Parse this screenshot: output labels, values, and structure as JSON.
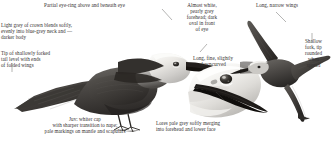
{
  "plate": {
    "subject": "noddy-tern-field-guide-plate",
    "background": "#ffffff",
    "text_color": "#333030"
  },
  "illustrations": [
    {
      "name": "perched-bird",
      "description": "Perched noddy in profile facing right, pale grey crown blending into blue-grey neck and dark brown-grey body, long dark bill, short dark legs with webbed feet",
      "position": "upper-left-to-center"
    },
    {
      "name": "head-study",
      "description": "Large close-up head study facing left, whitish pearly forehead and cap, dark oval before eye, long fine slightly downcurved black bill",
      "position": "lower-center"
    },
    {
      "name": "flying-bird",
      "description": "Bird in flight from above, long narrow pointed wings, shallow forked tail",
      "position": "right"
    }
  ],
  "labels": {
    "eyering": "Partial eye-ring above and beneath eye",
    "crown": "Light grey of crown blends softly,\nevenly into blue-grey neck and  —\ndarker body",
    "tail": "Tip of shallowly forked\ntail level with ends\nof folded wings",
    "juvenile": "Juv: whiter cap\nwith sharper transition to nape;\npale markings on mantle and scapulars",
    "forehead": "Almost white,\npearly grey\nforehead; dark\noval in front\nof eye",
    "bill": "Long, fine, slightly\ndowncurved",
    "lores": "Lores pale grey softly merging\ninto forehead and lower face",
    "wings": "Long, narrow wings",
    "fork": "Shallow\nfork, tip\nrounded\nwhen\nspread"
  }
}
